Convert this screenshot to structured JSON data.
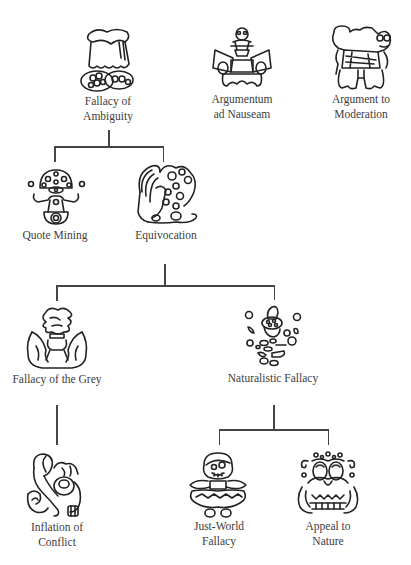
{
  "diagram": {
    "type": "tree",
    "title": "",
    "line_color": "#444444",
    "nodes": [
      {
        "id": "fallacy-of-ambiguity",
        "label_line1": "Fallacy of",
        "label_line2": "Ambiguity",
        "icon": "draped-creature-icon"
      },
      {
        "id": "argumentum-ad-nauseam",
        "label_line1": "Argumentum",
        "label_line2": "ad Nauseam",
        "icon": "skull-horn-creature-icon"
      },
      {
        "id": "argument-to-moderation",
        "label_line1": "Argument to",
        "label_line2": "Moderation",
        "icon": "twin-creature-icon"
      },
      {
        "id": "quote-mining",
        "label_line1": "Quote Mining",
        "icon": "mushroom-creature-icon"
      },
      {
        "id": "equivocation",
        "label_line1": "Equivocation",
        "icon": "winged-dragon-icon"
      },
      {
        "id": "fallacy-of-the-grey",
        "label_line1": "Fallacy of the Grey",
        "icon": "cloud-winged-icon"
      },
      {
        "id": "naturalistic-fallacy",
        "label_line1": "Naturalistic Fallacy",
        "icon": "floating-leaves-icon"
      },
      {
        "id": "inflation-of-conflict",
        "label_line1": "Inflation of",
        "label_line2": "Conflict",
        "icon": "serpent-creature-icon"
      },
      {
        "id": "just-world-fallacy",
        "label_line1": "Just-World",
        "label_line2": "Fallacy",
        "icon": "skirted-doll-icon"
      },
      {
        "id": "appeal-to-nature",
        "label_line1": "Appeal to",
        "label_line2": "Nature",
        "icon": "tentacle-creature-icon"
      }
    ],
    "edges": [
      {
        "from": "fallacy-of-ambiguity",
        "to": "quote-mining"
      },
      {
        "from": "fallacy-of-ambiguity",
        "to": "equivocation"
      },
      {
        "from": "equivocation",
        "to": "fallacy-of-the-grey"
      },
      {
        "from": "equivocation",
        "to": "naturalistic-fallacy"
      },
      {
        "from": "fallacy-of-the-grey",
        "to": "inflation-of-conflict"
      },
      {
        "from": "naturalistic-fallacy",
        "to": "just-world-fallacy"
      },
      {
        "from": "naturalistic-fallacy",
        "to": "appeal-to-nature"
      }
    ]
  }
}
